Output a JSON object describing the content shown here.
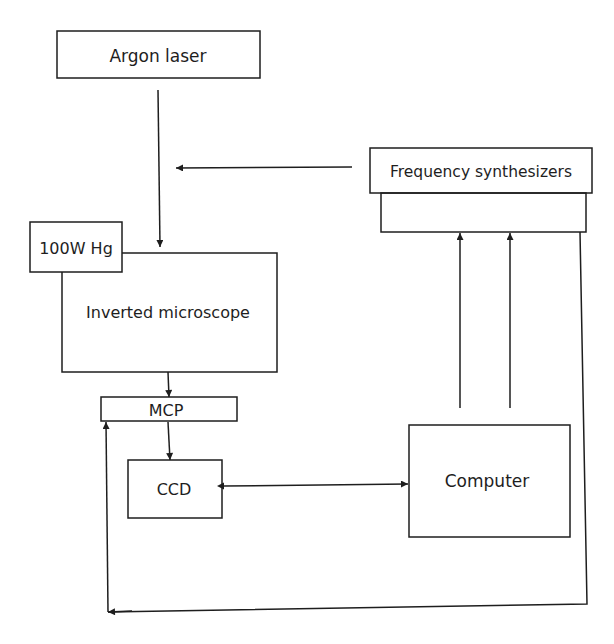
{
  "diagram": {
    "nodes": {
      "argon_laser": {
        "label": "Argon laser"
      },
      "frequency_synthesizers": {
        "label": "Frequency synthesizers"
      },
      "hg_lamp": {
        "label": "100W Hg"
      },
      "inverted_microscope": {
        "label": "Inverted microscope"
      },
      "mcp": {
        "label": "MCP"
      },
      "ccd": {
        "label": "CCD"
      },
      "computer": {
        "label": "Computer"
      }
    },
    "edges": [
      {
        "from": "Argon laser",
        "to": "Inverted microscope"
      },
      {
        "from": "Frequency synthesizers",
        "to": "Argon laser beam path"
      },
      {
        "from": "Computer",
        "to": "Frequency synthesizers",
        "count": 2
      },
      {
        "from": "Frequency synthesizers",
        "to": "MCP"
      },
      {
        "from": "Inverted microscope",
        "to": "MCP"
      },
      {
        "from": "MCP",
        "to": "CCD"
      },
      {
        "from": "CCD",
        "to": "Computer",
        "bidirectional": true
      }
    ],
    "colors": {
      "stroke": "#1e1e1e",
      "background": "#ffffff"
    }
  }
}
